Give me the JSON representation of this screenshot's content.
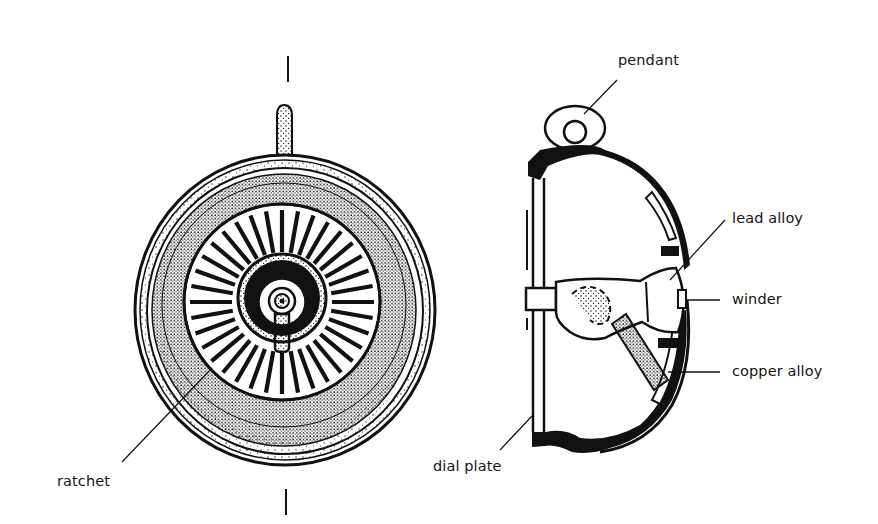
{
  "figure": {
    "colors": {
      "ink": "#111111",
      "background": "#ffffff",
      "label_text": "#141414"
    },
    "front_view": {
      "axis_marks": [
        "top-center-line",
        "bottom-center-line"
      ],
      "ratchet_teeth_count": 36,
      "labels": [
        {
          "id": "ratchet",
          "text": "ratchet"
        }
      ]
    },
    "cross_section": {
      "labels": [
        {
          "id": "pendant",
          "text": "pendant"
        },
        {
          "id": "lead_alloy",
          "text": "lead alloy"
        },
        {
          "id": "winder",
          "text": "winder"
        },
        {
          "id": "copper_alloy",
          "text": "copper alloy"
        },
        {
          "id": "dial_plate",
          "text": "dial plate"
        }
      ]
    }
  }
}
